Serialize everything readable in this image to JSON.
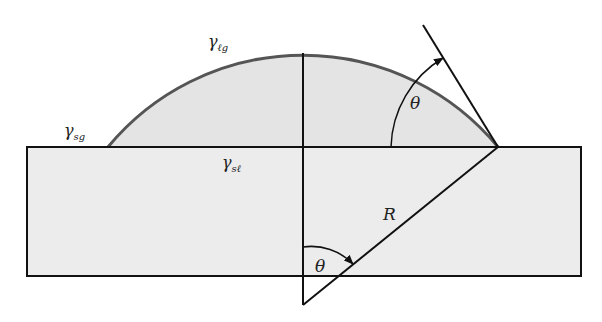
{
  "diagram": {
    "labels": {
      "gamma_lg": {
        "symbol": "γ",
        "subscript": "ℓg"
      },
      "gamma_sg": {
        "symbol": "γ",
        "subscript": "sg"
      },
      "gamma_sl": {
        "symbol": "γ",
        "subscript": "sℓ"
      },
      "theta_contact": "θ",
      "theta_center": "θ",
      "radius": "R"
    },
    "colors": {
      "background": "#ffffff",
      "substrate_fill": "#ececec",
      "drop_fill": "#e4e4e4",
      "drop_outline": "#555555",
      "lines": "#111111"
    }
  }
}
